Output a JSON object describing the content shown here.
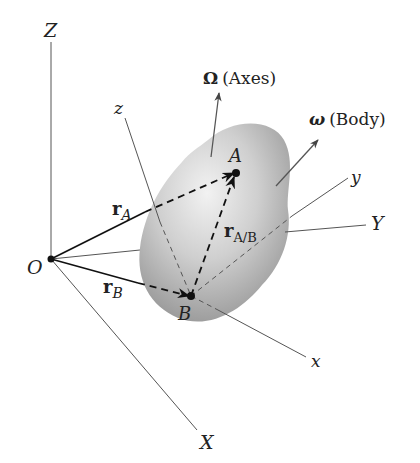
{
  "diagram": {
    "type": "rigid-body-kinematics",
    "fixed_axes": {
      "Z": "Z",
      "Y": "Y",
      "X": "X"
    },
    "body_axes": {
      "z": "z",
      "y": "y",
      "x": "x"
    },
    "origin": "O",
    "points": {
      "A": "A",
      "B": "B"
    },
    "vectors": {
      "rA": {
        "base": "r",
        "sub": "A"
      },
      "rB": {
        "base": "r",
        "sub": "B"
      },
      "rAB": {
        "base": "r",
        "sub": "A/B"
      }
    },
    "angular_velocities": {
      "axes": {
        "symbol": "Ω",
        "label": "(Axes)"
      },
      "body": {
        "symbol": "ω",
        "label": "(Body)"
      }
    }
  }
}
